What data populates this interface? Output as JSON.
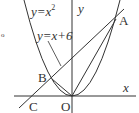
{
  "diagram": {
    "type": "coordinate-geometry",
    "colors": {
      "stroke": "#333333",
      "background": "#ffffff"
    },
    "axes": {
      "x_label": "x",
      "y_label": "y",
      "origin_label": "O"
    },
    "curves": [
      {
        "id": "parabola",
        "equation_label": "y=x",
        "exponent": "2"
      },
      {
        "id": "line",
        "equation_label": "y=x+6"
      }
    ],
    "points": [
      {
        "id": "A",
        "label": "A"
      },
      {
        "id": "B",
        "label": "B"
      },
      {
        "id": "C",
        "label": "C"
      },
      {
        "id": "O",
        "label": "O"
      }
    ],
    "marker": "o"
  }
}
